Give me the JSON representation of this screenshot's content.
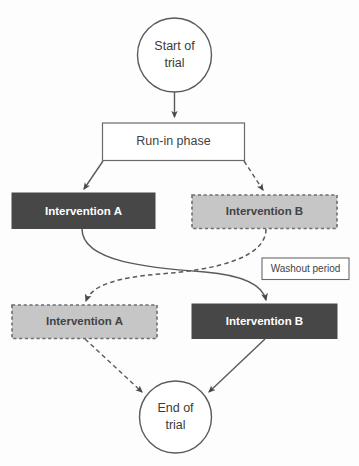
{
  "diagram": {
    "background_color": "#fdfdfd",
    "colors": {
      "dark_fill": "#474747",
      "light_fill": "#c6c6c6",
      "stroke": "#555555",
      "light_border": "#8e8e8e",
      "dark_text": "#434343",
      "white_text": "#ffffff"
    },
    "nodes": {
      "start": {
        "label_line1": "Start of",
        "label_line2": "trial",
        "shape": "circle"
      },
      "runin": {
        "label": "Run-in phase",
        "shape": "rectangle",
        "style": "outline"
      },
      "arm_a_period1": {
        "label": "Intervention A",
        "shape": "rectangle",
        "style": "solid-dark"
      },
      "arm_b_period1": {
        "label": "Intervention B",
        "shape": "rectangle",
        "style": "dashed-light"
      },
      "washout": {
        "label": "Washout period",
        "shape": "rectangle",
        "style": "outline"
      },
      "arm_a_period2": {
        "label": "Intervention A",
        "shape": "rectangle",
        "style": "dashed-light"
      },
      "arm_b_period2": {
        "label": "Intervention B",
        "shape": "rectangle",
        "style": "solid-dark"
      },
      "end": {
        "label_line1": "End of",
        "label_line2": "trial",
        "shape": "circle"
      }
    },
    "edges": [
      {
        "name": "start-to-runin",
        "from": "start",
        "to": "runin",
        "style": "solid"
      },
      {
        "name": "runin-to-intervention-a",
        "from": "runin",
        "to": "arm_a_period1",
        "style": "solid"
      },
      {
        "name": "runin-to-intervention-b",
        "from": "runin",
        "to": "arm_b_period1",
        "style": "dashed"
      },
      {
        "name": "crossover-a-to-b",
        "from": "arm_a_period1",
        "to": "arm_b_period2",
        "style": "solid"
      },
      {
        "name": "crossover-b-to-a",
        "from": "arm_b_period1",
        "to": "arm_a_period2",
        "style": "dashed"
      },
      {
        "name": "intervention-a-to-end",
        "from": "arm_a_period2",
        "to": "end",
        "style": "dashed"
      },
      {
        "name": "intervention-b-to-end",
        "from": "arm_b_period2",
        "to": "end",
        "style": "solid"
      }
    ]
  }
}
